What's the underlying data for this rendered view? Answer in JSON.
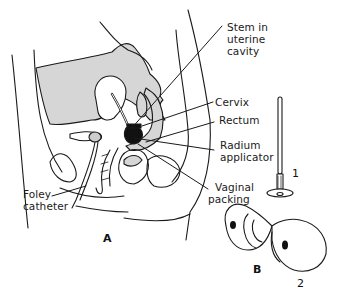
{
  "figure": {
    "panels": {
      "a": "A",
      "b": "B"
    },
    "labels": {
      "stem_line1": "Stem in",
      "stem_line2": "uterine",
      "stem_line3": "cavity",
      "cervix": "Cervix",
      "rectum": "Rectum",
      "radium_line1": "Radium",
      "radium_line2": "applicator",
      "vaginal_line1": "Vaginal",
      "vaginal_line2": "packing",
      "foley_line1": "Foley",
      "foley_line2": "catheter"
    },
    "parts": {
      "part1": "1",
      "part2": "2"
    },
    "colors": {
      "line": "#1a1a1a",
      "shade": "#d4d4d4",
      "applicator": "#111111",
      "background": "#ffffff"
    }
  }
}
